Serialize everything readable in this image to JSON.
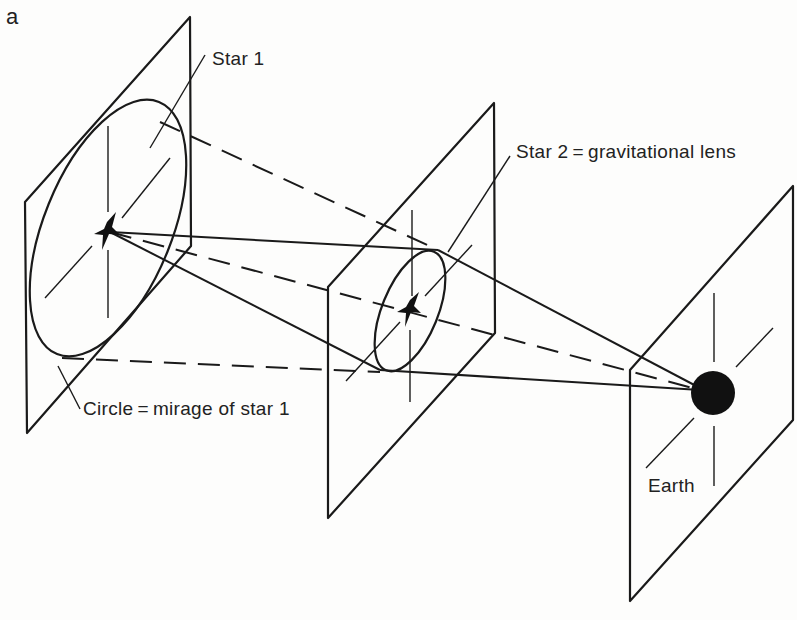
{
  "figure": {
    "panel_label": "a",
    "labels": {
      "star1": "Star 1",
      "star2": "Star 2 = gravitational lens",
      "circle": "Circle = mirage of star 1",
      "earth": "Earth"
    },
    "colors": {
      "ink": "#1a1a1a",
      "background": "#fdfdfc"
    }
  }
}
